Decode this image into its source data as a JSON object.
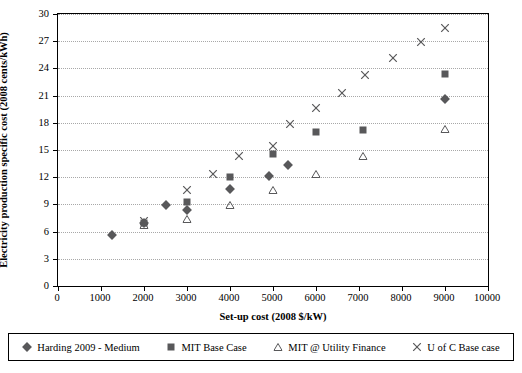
{
  "chart_data": {
    "type": "scatter",
    "title": "",
    "xlabel": "Set-up cost (2008 $/kW)",
    "ylabel": "Electricity production specific cost (2008 cents/kWh)",
    "xlim": [
      0,
      10000
    ],
    "ylim": [
      0,
      30
    ],
    "xticks": [
      0,
      1000,
      2000,
      3000,
      4000,
      5000,
      6000,
      7000,
      8000,
      9000,
      10000
    ],
    "yticks": [
      0,
      3,
      6,
      9,
      12,
      15,
      18,
      21,
      24,
      27,
      30
    ],
    "grid": "horizontal-dotted",
    "legend_position": "bottom",
    "series": [
      {
        "name": "Harding 2009 - Medium",
        "marker": "diamond",
        "color": "#58585a",
        "points": [
          {
            "x": 1250,
            "y": 5.6
          },
          {
            "x": 2000,
            "y": 7.0
          },
          {
            "x": 2500,
            "y": 8.9
          },
          {
            "x": 3000,
            "y": 8.4
          },
          {
            "x": 4000,
            "y": 10.7
          },
          {
            "x": 4900,
            "y": 12.1
          },
          {
            "x": 5350,
            "y": 13.4
          },
          {
            "x": 9000,
            "y": 20.6
          }
        ]
      },
      {
        "name": "MIT Base Case",
        "marker": "square",
        "color": "#58585a",
        "points": [
          {
            "x": 2000,
            "y": 6.9
          },
          {
            "x": 3000,
            "y": 9.3
          },
          {
            "x": 4000,
            "y": 12.0
          },
          {
            "x": 5000,
            "y": 14.6
          },
          {
            "x": 6000,
            "y": 17.0
          },
          {
            "x": 7100,
            "y": 17.2
          },
          {
            "x": 9000,
            "y": 23.4
          }
        ]
      },
      {
        "name": "MIT @ Utility Finance",
        "marker": "triangle",
        "color": "#58585a",
        "points": [
          {
            "x": 2000,
            "y": 6.7
          },
          {
            "x": 3000,
            "y": 7.4
          },
          {
            "x": 4000,
            "y": 8.9
          },
          {
            "x": 5000,
            "y": 10.6
          },
          {
            "x": 6000,
            "y": 12.4
          },
          {
            "x": 7100,
            "y": 14.3
          },
          {
            "x": 9000,
            "y": 17.3
          }
        ]
      },
      {
        "name": "U of C Base case",
        "marker": "cross",
        "color": "#58585a",
        "points": [
          {
            "x": 2000,
            "y": 7.2
          },
          {
            "x": 3000,
            "y": 10.6
          },
          {
            "x": 3600,
            "y": 12.4
          },
          {
            "x": 4200,
            "y": 14.3
          },
          {
            "x": 5000,
            "y": 15.4
          },
          {
            "x": 5400,
            "y": 17.9
          },
          {
            "x": 6000,
            "y": 19.6
          },
          {
            "x": 6600,
            "y": 21.3
          },
          {
            "x": 7150,
            "y": 23.3
          },
          {
            "x": 7800,
            "y": 25.1
          },
          {
            "x": 8450,
            "y": 26.9
          },
          {
            "x": 9000,
            "y": 28.5
          }
        ]
      }
    ]
  }
}
